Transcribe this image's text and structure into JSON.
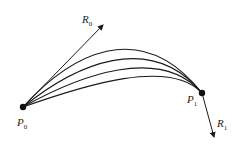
{
  "diagram": {
    "type": "hermite-curve-family",
    "points": {
      "p0": {
        "label": "P",
        "sub": "0",
        "x": 23,
        "y": 107
      },
      "p1": {
        "label": "P",
        "sub": "1",
        "x": 202,
        "y": 93
      }
    },
    "tangents": {
      "r0": {
        "label": "R",
        "sub": "0",
        "tip_x": 103,
        "tip_y": 25
      },
      "r1": {
        "label": "R",
        "sub": "1",
        "tip_x": 214,
        "tip_y": 137
      }
    },
    "curve_count": 4,
    "stroke_color": "#1a1a1a"
  }
}
